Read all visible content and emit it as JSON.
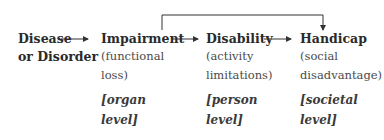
{
  "diagram": {
    "type": "flow",
    "nodes": [
      {
        "id": "disease",
        "title_line1": "Disease",
        "title_line2": "or Disorder"
      },
      {
        "id": "impairment",
        "title": "Impairment",
        "desc_line1": "(functional",
        "desc_line2": "loss)",
        "level_line1": "[organ",
        "level_line2": "level]"
      },
      {
        "id": "disability",
        "title": "Disability",
        "desc_line1": "(activity",
        "desc_line2": "limitations)",
        "level_line1": "[person",
        "level_line2": "level]"
      },
      {
        "id": "handicap",
        "title": "Handicap",
        "desc_line1": "(social",
        "desc_line2": "disadvantage)",
        "level_line1": "[societal",
        "level_line2": "level]"
      }
    ],
    "edges": [
      {
        "from": "disease",
        "to": "impairment"
      },
      {
        "from": "impairment",
        "to": "disability"
      },
      {
        "from": "disability",
        "to": "handicap"
      },
      {
        "from": "impairment",
        "to": "handicap",
        "style": "elbow-over-top"
      }
    ],
    "colors": {
      "text": "#2a2a2a",
      "line": "#333333",
      "background": "#ffffff"
    }
  }
}
